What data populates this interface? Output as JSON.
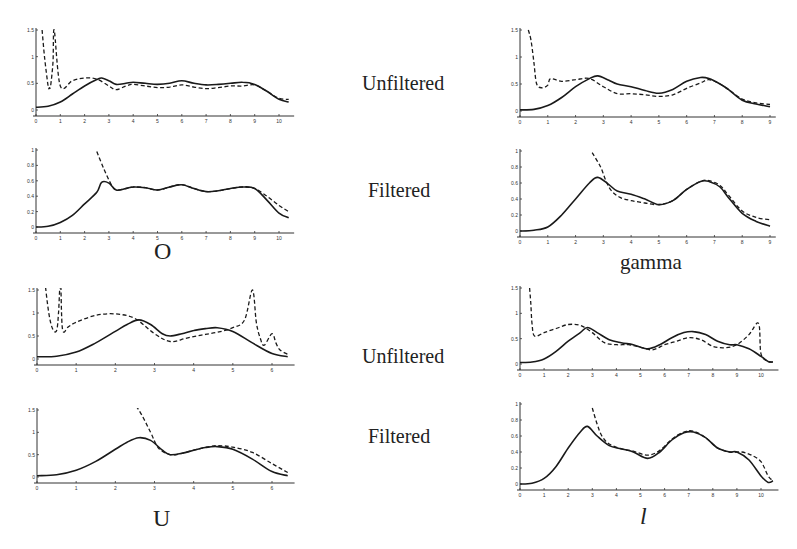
{
  "row_labels": [
    "Unfiltered",
    "Filtered",
    "Unfiltered",
    "Filtered"
  ],
  "panel_labels": {
    "O": "O",
    "gamma": "gamma",
    "U": "U",
    "l": "l"
  },
  "chart_data": [
    {
      "id": "O-unfiltered",
      "panel": "O",
      "condition": "Unfiltered",
      "type": "line",
      "xlim": [
        0,
        10.5
      ],
      "ylim": [
        0,
        1.5
      ],
      "xticks": [
        0,
        1,
        2,
        3,
        4,
        5,
        6,
        7,
        8,
        9,
        10
      ],
      "yticks": [
        0,
        0.5,
        1,
        1.5
      ],
      "ytick_labels": [
        "0",
        "0.5",
        "1",
        "1.5"
      ],
      "series": [
        {
          "name": "solid",
          "style": "solid",
          "x": [
            0,
            0.5,
            1,
            1.5,
            2,
            2.5,
            2.7,
            3,
            3.3,
            3.7,
            4,
            4.5,
            5,
            5.5,
            6,
            6.5,
            7,
            7.5,
            8,
            8.5,
            9,
            9.5,
            10,
            10.4
          ],
          "y": [
            0.05,
            0.07,
            0.15,
            0.3,
            0.45,
            0.57,
            0.6,
            0.55,
            0.48,
            0.5,
            0.52,
            0.5,
            0.48,
            0.5,
            0.55,
            0.5,
            0.47,
            0.48,
            0.5,
            0.52,
            0.48,
            0.35,
            0.2,
            0.15
          ]
        },
        {
          "name": "dashed",
          "style": "dashed",
          "x": [
            0.25,
            0.35,
            0.5,
            0.55,
            0.6,
            0.7,
            0.75,
            1,
            1.5,
            2,
            2.5,
            3,
            3.3,
            3.7,
            4,
            4.5,
            5,
            5.5,
            6,
            6.5,
            7,
            7.5,
            8,
            8.5,
            9,
            9.5,
            10,
            10.4
          ],
          "y": [
            1.5,
            1.0,
            0.45,
            0.42,
            0.45,
            0.9,
            1.5,
            0.45,
            0.55,
            0.6,
            0.58,
            0.45,
            0.38,
            0.45,
            0.48,
            0.45,
            0.42,
            0.43,
            0.47,
            0.43,
            0.4,
            0.42,
            0.45,
            0.45,
            0.47,
            0.35,
            0.22,
            0.2
          ]
        }
      ]
    },
    {
      "id": "O-filtered",
      "panel": "O",
      "condition": "Filtered",
      "type": "line",
      "xlim": [
        0,
        10.5
      ],
      "ylim": [
        0,
        1
      ],
      "xticks": [
        0,
        1,
        2,
        3,
        4,
        5,
        6,
        7,
        8,
        9,
        10
      ],
      "yticks": [
        0,
        0.2,
        0.4,
        0.6,
        0.8,
        1
      ],
      "ytick_labels": [
        "0",
        "0.2",
        "0.4",
        "0.6",
        "0.8",
        "1"
      ],
      "series": [
        {
          "name": "solid",
          "style": "solid",
          "x": [
            0,
            0.5,
            1,
            1.5,
            2,
            2.5,
            2.7,
            3,
            3.3,
            3.7,
            4,
            4.5,
            5,
            5.5,
            6,
            6.5,
            7,
            7.5,
            8,
            8.5,
            9,
            9.5,
            10,
            10.4
          ],
          "y": [
            0,
            0.01,
            0.06,
            0.15,
            0.3,
            0.45,
            0.58,
            0.57,
            0.48,
            0.5,
            0.52,
            0.51,
            0.48,
            0.52,
            0.55,
            0.5,
            0.46,
            0.47,
            0.5,
            0.52,
            0.5,
            0.35,
            0.18,
            0.12
          ]
        },
        {
          "name": "dashed",
          "style": "dashed",
          "x": [
            2.5,
            2.8,
            3.1,
            3.3,
            3.7,
            4,
            4.5,
            5,
            5.5,
            6,
            6.5,
            7,
            7.5,
            8,
            8.5,
            9,
            9.5,
            10,
            10.4
          ],
          "y": [
            0.98,
            0.75,
            0.55,
            0.48,
            0.5,
            0.52,
            0.51,
            0.48,
            0.52,
            0.55,
            0.5,
            0.46,
            0.47,
            0.5,
            0.52,
            0.5,
            0.4,
            0.28,
            0.2
          ]
        }
      ]
    },
    {
      "id": "gamma-unfiltered",
      "panel": "gamma",
      "condition": "Unfiltered",
      "type": "line",
      "xlim": [
        0,
        9.1
      ],
      "ylim": [
        0,
        1.5
      ],
      "xticks": [
        0,
        1,
        2,
        3,
        4,
        5,
        6,
        7,
        8,
        9
      ],
      "yticks": [
        0,
        0.5,
        1,
        1.5
      ],
      "ytick_labels": [
        "0",
        "0.5",
        "1",
        "1.5"
      ],
      "series": [
        {
          "name": "solid",
          "style": "solid",
          "x": [
            0,
            0.5,
            1,
            1.5,
            2,
            2.5,
            2.8,
            3.2,
            3.5,
            4,
            4.5,
            5,
            5.5,
            6,
            6.5,
            6.8,
            7.2,
            7.5,
            8,
            8.5,
            9
          ],
          "y": [
            0.02,
            0.03,
            0.1,
            0.25,
            0.45,
            0.6,
            0.65,
            0.57,
            0.5,
            0.45,
            0.38,
            0.33,
            0.4,
            0.55,
            0.62,
            0.6,
            0.5,
            0.4,
            0.2,
            0.13,
            0.08
          ]
        },
        {
          "name": "dashed",
          "style": "dashed",
          "x": [
            0.3,
            0.4,
            0.5,
            0.6,
            0.8,
            1,
            1.1,
            1.5,
            2,
            2.5,
            3,
            3.5,
            4,
            4.5,
            5,
            5.5,
            6,
            6.5,
            6.8,
            7.2,
            7.5,
            8,
            8.5,
            9
          ],
          "y": [
            1.5,
            1.3,
            0.9,
            0.5,
            0.43,
            0.48,
            0.6,
            0.55,
            0.58,
            0.6,
            0.45,
            0.32,
            0.32,
            0.3,
            0.27,
            0.3,
            0.42,
            0.52,
            0.58,
            0.5,
            0.4,
            0.22,
            0.15,
            0.12
          ]
        }
      ]
    },
    {
      "id": "gamma-filtered",
      "panel": "gamma",
      "condition": "Filtered",
      "type": "line",
      "xlim": [
        0,
        9.1
      ],
      "ylim": [
        0,
        1
      ],
      "xticks": [
        0,
        1,
        2,
        3,
        4,
        5,
        6,
        7,
        8,
        9
      ],
      "yticks": [
        0,
        0.2,
        0.4,
        0.6,
        0.8,
        1
      ],
      "ytick_labels": [
        "0",
        "0.2",
        "0.4",
        "0.6",
        "0.8",
        "1"
      ],
      "series": [
        {
          "name": "solid",
          "style": "solid",
          "x": [
            0,
            0.5,
            1,
            1.5,
            2,
            2.5,
            2.8,
            3.2,
            3.5,
            4,
            4.5,
            5,
            5.5,
            6,
            6.5,
            6.8,
            7.2,
            7.5,
            8,
            8.5,
            9
          ],
          "y": [
            0,
            0.01,
            0.05,
            0.2,
            0.4,
            0.6,
            0.67,
            0.58,
            0.5,
            0.46,
            0.4,
            0.33,
            0.38,
            0.52,
            0.62,
            0.62,
            0.55,
            0.42,
            0.22,
            0.12,
            0.06
          ]
        },
        {
          "name": "dashed",
          "style": "dashed",
          "x": [
            2.6,
            2.9,
            3.1,
            3.3,
            3.6,
            4,
            4.5,
            5,
            5.5,
            6,
            6.5,
            6.8,
            7.2,
            7.5,
            8,
            8.5,
            9
          ],
          "y": [
            0.98,
            0.8,
            0.62,
            0.5,
            0.42,
            0.38,
            0.35,
            0.33,
            0.38,
            0.52,
            0.62,
            0.63,
            0.57,
            0.45,
            0.25,
            0.17,
            0.14
          ]
        }
      ]
    },
    {
      "id": "U-unfiltered",
      "panel": "U",
      "condition": "Unfiltered",
      "type": "line",
      "xlim": [
        0,
        6.5
      ],
      "ylim": [
        0,
        1.5
      ],
      "xticks": [
        0,
        1,
        2,
        3,
        4,
        5,
        6
      ],
      "yticks": [
        0,
        0.5,
        1,
        1.5
      ],
      "ytick_labels": [
        "0",
        "0.5",
        "1",
        "1.5"
      ],
      "series": [
        {
          "name": "solid",
          "style": "solid",
          "x": [
            0,
            0.5,
            1,
            1.5,
            2,
            2.3,
            2.6,
            2.9,
            3.2,
            3.4,
            3.7,
            4,
            4.3,
            4.6,
            5,
            5.5,
            6,
            6.4
          ],
          "y": [
            0.05,
            0.06,
            0.15,
            0.35,
            0.6,
            0.75,
            0.85,
            0.75,
            0.55,
            0.5,
            0.55,
            0.62,
            0.66,
            0.68,
            0.6,
            0.35,
            0.12,
            0.05
          ]
        },
        {
          "name": "dashed",
          "style": "dashed",
          "x": [
            0.2,
            0.3,
            0.4,
            0.5,
            0.55,
            0.6,
            0.65,
            0.8,
            1,
            1.5,
            2,
            2.5,
            3,
            3.4,
            3.8,
            4.2,
            4.6,
            5,
            5.3,
            5.5,
            5.6,
            5.7,
            5.8,
            6,
            6.1,
            6.2,
            6.4
          ],
          "y": [
            1.7,
            1.0,
            0.65,
            0.62,
            1.0,
            1.7,
            0.65,
            0.7,
            0.8,
            0.95,
            0.98,
            0.88,
            0.55,
            0.38,
            0.45,
            0.52,
            0.58,
            0.68,
            0.85,
            1.5,
            0.8,
            0.45,
            0.3,
            0.55,
            0.35,
            0.2,
            0.1
          ]
        }
      ]
    },
    {
      "id": "U-filtered",
      "panel": "U",
      "condition": "Filtered",
      "type": "line",
      "xlim": [
        0,
        6.5
      ],
      "ylim": [
        0,
        1.5
      ],
      "xticks": [
        0,
        1,
        2,
        3,
        4,
        5,
        6
      ],
      "yticks": [
        0,
        0.5,
        1,
        1.5
      ],
      "ytick_labels": [
        "0",
        "0.5",
        "1",
        "1.5"
      ],
      "series": [
        {
          "name": "solid",
          "style": "solid",
          "x": [
            0,
            0.5,
            1,
            1.5,
            2,
            2.3,
            2.6,
            2.9,
            3.2,
            3.4,
            3.7,
            4,
            4.3,
            4.6,
            5,
            5.5,
            6,
            6.4
          ],
          "y": [
            0.03,
            0.05,
            0.15,
            0.35,
            0.62,
            0.78,
            0.88,
            0.82,
            0.6,
            0.5,
            0.53,
            0.6,
            0.66,
            0.68,
            0.62,
            0.4,
            0.12,
            0.03
          ]
        },
        {
          "name": "dashed",
          "style": "dashed",
          "x": [
            2.3,
            2.6,
            2.9,
            3.1,
            3.4,
            3.7,
            4,
            4.3,
            4.6,
            5,
            5.5,
            6,
            6.4
          ],
          "y": [
            1.8,
            1.5,
            1.0,
            0.65,
            0.5,
            0.53,
            0.6,
            0.66,
            0.7,
            0.67,
            0.55,
            0.3,
            0.1
          ]
        }
      ]
    },
    {
      "id": "l-unfiltered",
      "panel": "l",
      "condition": "Unfiltered",
      "type": "line",
      "xlim": [
        0,
        10.6
      ],
      "ylim": [
        0,
        1.5
      ],
      "xticks": [
        0,
        1,
        2,
        3,
        4,
        5,
        6,
        7,
        8,
        9,
        10
      ],
      "yticks": [
        0,
        0.5,
        1,
        1.5
      ],
      "ytick_labels": [
        "0",
        "0.5",
        "1",
        "1.5"
      ],
      "series": [
        {
          "name": "solid",
          "style": "solid",
          "x": [
            0,
            0.5,
            1,
            1.5,
            2,
            2.5,
            2.8,
            3.2,
            3.7,
            4.2,
            4.7,
            5.3,
            5.8,
            6.3,
            6.8,
            7.2,
            7.7,
            8.2,
            8.7,
            9,
            9.5,
            10,
            10.3,
            10.5
          ],
          "y": [
            0.03,
            0.04,
            0.1,
            0.25,
            0.45,
            0.62,
            0.72,
            0.62,
            0.48,
            0.42,
            0.38,
            0.3,
            0.38,
            0.52,
            0.62,
            0.64,
            0.58,
            0.45,
            0.38,
            0.38,
            0.3,
            0.15,
            0.05,
            0.04
          ]
        },
        {
          "name": "dashed",
          "style": "dashed",
          "x": [
            0.4,
            0.45,
            0.5,
            0.6,
            1,
            1.5,
            2,
            2.5,
            3,
            3.5,
            4,
            4.5,
            5,
            5.5,
            6,
            6.5,
            7,
            7.5,
            8,
            8.5,
            9,
            9.5,
            9.9,
            10,
            10.3,
            10.5
          ],
          "y": [
            1.5,
            1.2,
            0.8,
            0.55,
            0.62,
            0.7,
            0.78,
            0.76,
            0.62,
            0.42,
            0.38,
            0.38,
            0.33,
            0.28,
            0.38,
            0.45,
            0.52,
            0.48,
            0.35,
            0.32,
            0.38,
            0.58,
            0.8,
            0.2,
            0.05,
            0.04
          ]
        }
      ]
    },
    {
      "id": "l-filtered",
      "panel": "l",
      "condition": "Filtered",
      "type": "line",
      "xlim": [
        0,
        10.6
      ],
      "ylim": [
        0,
        1
      ],
      "xticks": [
        0,
        1,
        2,
        3,
        4,
        5,
        6,
        7,
        8,
        9,
        10
      ],
      "yticks": [
        0,
        0.2,
        0.4,
        0.6,
        0.8,
        1
      ],
      "ytick_labels": [
        "0",
        "0.2",
        "0.4",
        "0.6",
        "0.8",
        "1"
      ],
      "series": [
        {
          "name": "solid",
          "style": "solid",
          "x": [
            0,
            0.5,
            1,
            1.5,
            2,
            2.5,
            2.8,
            3.2,
            3.7,
            4.2,
            4.7,
            5.3,
            5.8,
            6.3,
            6.8,
            7.2,
            7.7,
            8.2,
            8.7,
            9,
            9.5,
            10,
            10.3,
            10.5
          ],
          "y": [
            0,
            0.01,
            0.07,
            0.22,
            0.45,
            0.65,
            0.72,
            0.6,
            0.48,
            0.44,
            0.4,
            0.32,
            0.4,
            0.55,
            0.64,
            0.65,
            0.58,
            0.45,
            0.4,
            0.4,
            0.3,
            0.1,
            0.02,
            0.04
          ]
        },
        {
          "name": "dashed",
          "style": "dashed",
          "x": [
            3.0,
            3.2,
            3.4,
            3.7,
            4.2,
            4.7,
            5.3,
            5.8,
            6.3,
            6.8,
            7.2,
            7.7,
            8.2,
            8.7,
            9.2,
            9.6,
            10,
            10.3,
            10.5
          ],
          "y": [
            0.95,
            0.75,
            0.6,
            0.5,
            0.44,
            0.41,
            0.36,
            0.42,
            0.56,
            0.65,
            0.66,
            0.58,
            0.45,
            0.4,
            0.4,
            0.36,
            0.28,
            0.1,
            0.04
          ]
        }
      ]
    }
  ]
}
